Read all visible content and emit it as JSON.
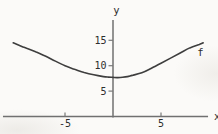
{
  "figure": {
    "colors": {
      "background": "#fbfaf8",
      "axis": "#707070",
      "tick": "#7a7a7a",
      "curve": "#3e3e3e",
      "text": "#2d2d2d"
    }
  },
  "chart_data": {
    "type": "line",
    "title": "",
    "xlabel": "x",
    "ylabel": "y",
    "x_ticks": [
      -5,
      5
    ],
    "y_ticks": [
      5,
      10,
      15
    ],
    "xlim": [
      -11.5,
      10.9
    ],
    "ylim": [
      -3.4,
      19.0
    ],
    "grid": false,
    "legend": "curve labeled f near its upper right end",
    "series": [
      {
        "name": "f",
        "label": "f",
        "label_at": [
          9.1,
          12.6
        ],
        "points": [
          [
            -10.4,
            14.5
          ],
          [
            -9.5,
            13.8
          ],
          [
            -9,
            13.45
          ],
          [
            -8,
            12.7
          ],
          [
            -7,
            11.85
          ],
          [
            -6,
            10.9
          ],
          [
            -5,
            10.0
          ],
          [
            -4,
            9.3
          ],
          [
            -3,
            8.65
          ],
          [
            -2,
            8.2
          ],
          [
            -1,
            7.85
          ],
          [
            -0.5,
            7.75
          ],
          [
            0,
            7.7
          ],
          [
            0.5,
            7.65
          ],
          [
            1,
            7.72
          ],
          [
            1.5,
            7.85
          ],
          [
            2,
            8.1
          ],
          [
            3,
            8.6
          ],
          [
            4,
            9.5
          ],
          [
            5,
            10.5
          ],
          [
            6,
            11.5
          ],
          [
            7,
            12.5
          ],
          [
            8,
            13.5
          ],
          [
            9,
            14.2
          ],
          [
            9.4,
            14.5
          ]
        ]
      }
    ],
    "axes_drawn": {
      "x_axis_span": [
        -11.46,
        9.9
      ],
      "y_axis_span": [
        -0.2,
        19.0
      ]
    },
    "pixel_mapping": {
      "origin_px": [
        113,
        116.5
      ],
      "px_per_unit_x": 9.6,
      "px_per_unit_y": 5.08
    }
  }
}
